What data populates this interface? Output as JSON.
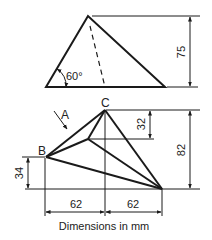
{
  "figure": {
    "caption": "Dimensions in mm",
    "colors": {
      "line": "#1a1a1a",
      "background": "#ffffff"
    },
    "top_view": {
      "angle_label": "60°",
      "height_dim": "75"
    },
    "bottom_view": {
      "point_labels": {
        "A": "A",
        "B": "B",
        "C": "C"
      },
      "dims": {
        "upper_offset": "32",
        "total_height": "82",
        "b_height": "34",
        "left_width": "62",
        "right_width": "62"
      }
    }
  }
}
